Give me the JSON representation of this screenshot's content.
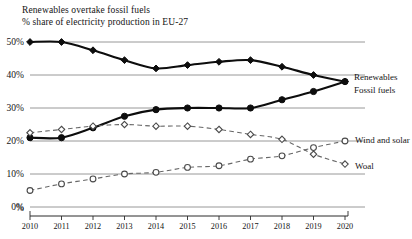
{
  "header": {
    "title": "Renewables overtake fossil fuels",
    "subtitle": "% share of electricity production in EU-27"
  },
  "axis": {
    "y_ticks": [
      "0%",
      "10%",
      "20%",
      "30%",
      "40%",
      "50%"
    ],
    "x_ticks": [
      "2010",
      "2011",
      "2012",
      "2013",
      "2014",
      "2015",
      "2016",
      "2017",
      "2018",
      "2019",
      "2020"
    ],
    "y_axis_corner_label": "%"
  },
  "series_labels": {
    "renewables": "Renewables",
    "fossil_fuels": "Fossil fuels",
    "wind_and_solar": "Wind and solar",
    "coal": "Woal"
  },
  "chart_data": {
    "type": "line",
    "title": "Renewables overtake fossil fuels",
    "subtitle": "% share of electricity production in EU-27",
    "xlabel": "",
    "ylabel": "%",
    "x": [
      "2010",
      "2011",
      "2012",
      "2013",
      "2014",
      "2015",
      "2016",
      "2017",
      "2018",
      "2019",
      "2020"
    ],
    "ylim": [
      0,
      52
    ],
    "ytick_values": [
      0,
      10,
      20,
      30,
      40,
      50
    ],
    "grid": "horizontal",
    "legend_position": "right-inline-labels",
    "series": [
      {
        "name": "Fossil fuels",
        "style": "solid",
        "marker": "filled-diamond",
        "color": "#0d0d0d",
        "values": [
          50,
          50,
          47.5,
          44.5,
          42,
          43,
          44,
          44.5,
          42.5,
          40,
          38
        ]
      },
      {
        "name": "Renewables",
        "style": "solid",
        "marker": "filled-circle",
        "color": "#0d0d0d",
        "values": [
          21,
          21,
          24,
          27.5,
          29.5,
          30,
          30,
          30,
          32.5,
          35,
          38
        ]
      },
      {
        "name": "Woal",
        "style": "dashed",
        "marker": "open-diamond",
        "color": "#676767",
        "values": [
          22.5,
          23.5,
          24.5,
          25,
          24.5,
          24.5,
          23.5,
          22,
          20.5,
          16,
          13
        ]
      },
      {
        "name": "Wind and solar",
        "style": "dashed",
        "marker": "open-circle",
        "color": "#676767",
        "values": [
          5,
          7,
          8.5,
          10,
          10.5,
          12,
          12.5,
          14.5,
          15.5,
          18,
          20
        ]
      }
    ]
  }
}
